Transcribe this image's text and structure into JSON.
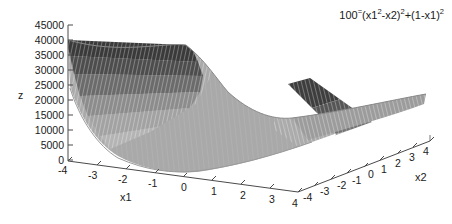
{
  "figure": {
    "type": "surface-plot-3d",
    "title_parts": {
      "coefficient": "100",
      "operator": "=",
      "body_a": "(x1",
      "exp_a": "2",
      "body_b": "-x2)",
      "exp_b": "2",
      "body_c": "+(1-x1)",
      "exp_c": "2"
    },
    "background_color": "#ffffff",
    "axis_color": "#4a4a4a"
  },
  "chart_data": {
    "type": "surface",
    "function": "100*(x1^2 - x2)^2 + (1 - x1)^2",
    "xlabel": "x1",
    "ylabel": "x2",
    "zlabel": "z",
    "xlim": [
      -4,
      4
    ],
    "ylim": [
      -4,
      4
    ],
    "zlim": [
      0,
      45000
    ],
    "grid": false,
    "legend": false,
    "projection": "3d",
    "colormap": "grayscale-banded",
    "z_ticks": [
      0,
      5000,
      10000,
      15000,
      20000,
      25000,
      30000,
      35000,
      40000,
      45000
    ],
    "z_tick_labels": [
      "0",
      "5000",
      "10000",
      "15000",
      "20000",
      "25000",
      "30000",
      "35000",
      "40000",
      "45000"
    ],
    "x1_ticks": [
      -4,
      -3,
      -2,
      -1,
      0,
      1,
      2,
      3,
      4
    ],
    "x1_tick_labels": [
      "-4",
      "-3",
      "-2",
      "-1",
      "0",
      "1",
      "2",
      "3",
      "4"
    ],
    "x2_ticks": [
      -4,
      -3,
      -2,
      -1,
      0,
      1,
      2,
      3,
      4
    ],
    "x2_tick_labels": [
      "-4",
      "-3",
      "-2",
      "-1",
      "0",
      "1",
      "2",
      "3",
      "4"
    ],
    "features": {
      "minimum_location": [
        1,
        1
      ],
      "minimum_value": 0,
      "peak_left_value": 40000,
      "peak_right_value": 25000,
      "shape": "banana-shaped valley with steep parabolic walls"
    },
    "band_levels": [
      {
        "z_from": 0,
        "z_to": 8000,
        "color": "#b4b4b4"
      },
      {
        "z_from": 8000,
        "z_to": 16000,
        "color": "#a0a0a0"
      },
      {
        "z_from": 16000,
        "z_to": 24000,
        "color": "#8a8a8a"
      },
      {
        "z_from": 24000,
        "z_to": 32000,
        "color": "#6e6e6e"
      },
      {
        "z_from": 32000,
        "z_to": 40000,
        "color": "#4a4a4a"
      },
      {
        "z_from": 40000,
        "z_to": 45000,
        "color": "#363636"
      }
    ]
  },
  "axes": {
    "z": {
      "label": "z",
      "ticks": [
        {
          "label": "45000",
          "top": 20
        },
        {
          "label": "40000",
          "top": 35
        },
        {
          "label": "35000",
          "top": 50
        },
        {
          "label": "30000",
          "top": 65
        },
        {
          "label": "25000",
          "top": 80
        },
        {
          "label": "20000",
          "top": 95
        },
        {
          "label": "15000",
          "top": 110
        },
        {
          "label": "10000",
          "top": 125
        },
        {
          "label": "5000",
          "top": 140
        },
        {
          "label": "0",
          "top": 155
        }
      ]
    },
    "x1": {
      "label": "x1",
      "ticks": [
        {
          "label": "-4",
          "left": 58,
          "top": 165
        },
        {
          "label": "-3",
          "left": 88,
          "top": 170
        },
        {
          "label": "-2",
          "left": 118,
          "top": 174
        },
        {
          "label": "-1",
          "left": 148,
          "top": 178
        },
        {
          "label": "0",
          "left": 181,
          "top": 182
        },
        {
          "label": "1",
          "left": 211,
          "top": 186
        },
        {
          "label": "2",
          "left": 240,
          "top": 190
        },
        {
          "label": "3",
          "left": 269,
          "top": 194
        },
        {
          "label": "4",
          "left": 292,
          "top": 198
        }
      ]
    },
    "x2": {
      "label": "x2",
      "ticks": [
        {
          "label": "-4",
          "left": 303,
          "top": 192
        },
        {
          "label": "-3",
          "left": 320,
          "top": 186
        },
        {
          "label": "-2",
          "left": 337,
          "top": 180
        },
        {
          "label": "-1",
          "left": 352,
          "top": 175
        },
        {
          "label": "0",
          "left": 368,
          "top": 169
        },
        {
          "label": "1",
          "left": 381,
          "top": 164
        },
        {
          "label": "2",
          "left": 395,
          "top": 158
        },
        {
          "label": "3",
          "left": 409,
          "top": 152
        },
        {
          "label": "4",
          "left": 423,
          "top": 146
        }
      ]
    }
  }
}
